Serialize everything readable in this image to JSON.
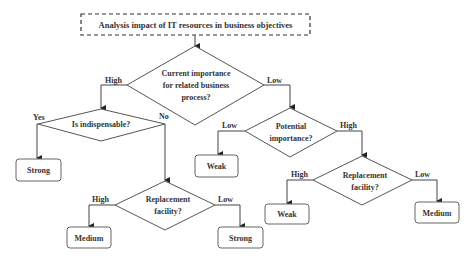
{
  "diagram": {
    "title": "Analysis impact of IT resources in business objectives",
    "decisions": {
      "current_importance": [
        "Current importance",
        "for related business",
        "process?"
      ],
      "indispensable": "Is indispensable?",
      "potential_importance": [
        "Potential",
        "importance?"
      ],
      "replacement_left": [
        "Replacement",
        "facility?"
      ],
      "replacement_right": [
        "Replacement",
        "facility?"
      ]
    },
    "edges": {
      "current_high": "High",
      "current_low": "Low",
      "indisp_yes": "Yes",
      "indisp_no": "No",
      "potential_low": "Low",
      "potential_high": "High",
      "repl_left_high": "High",
      "repl_left_low": "Low",
      "repl_right_high": "High",
      "repl_right_low": "Low"
    },
    "outcomes": {
      "indisp_yes": "Strong",
      "repl_left_high": "Medium",
      "repl_left_low": "Strong",
      "potential_low": "Weak",
      "repl_right_high": "Weak",
      "repl_right_low": "Medium"
    }
  }
}
